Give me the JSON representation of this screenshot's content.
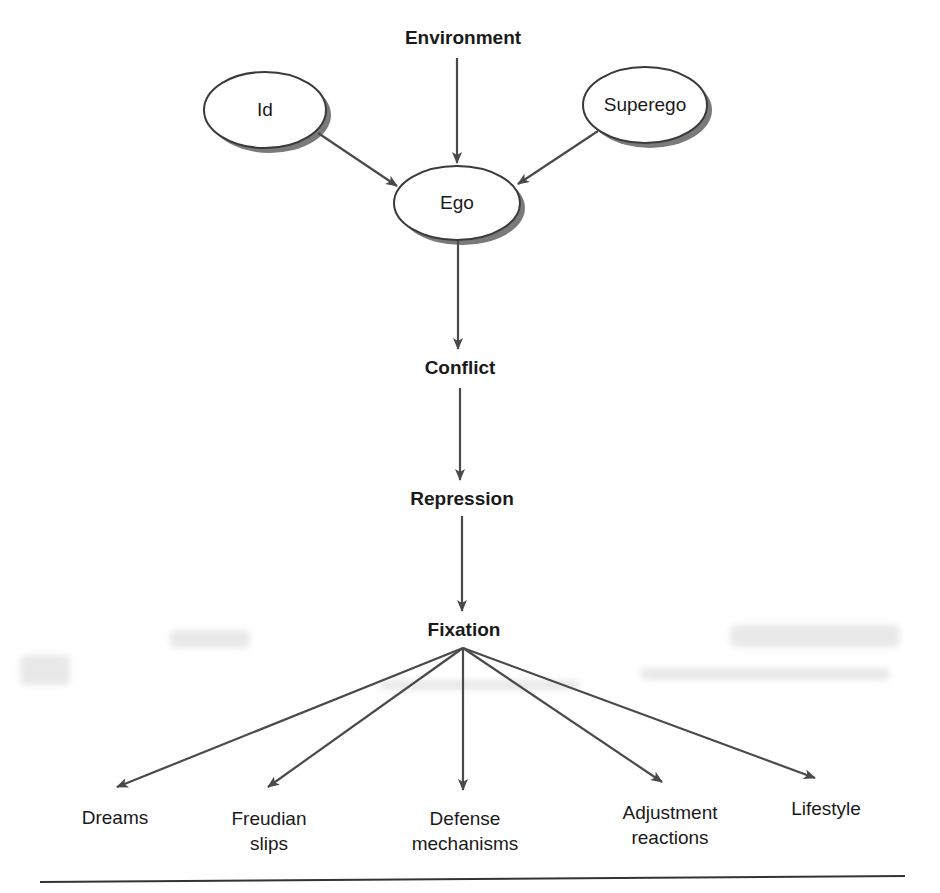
{
  "diagram": {
    "title": "",
    "colors": {
      "line": "#4a4a4a",
      "ellipse_fill": "#ffffff",
      "ellipse_stroke": "#3a3a3a",
      "shadow": "#7a7a7a",
      "text": "#1a1a1a"
    },
    "nodes": [
      {
        "id": "environment",
        "label": "Environment",
        "shape": "text",
        "bold": true,
        "x": 463,
        "y": 38
      },
      {
        "id": "id",
        "label": "Id",
        "shape": "ellipse",
        "x": 265,
        "y": 110,
        "rx": 61,
        "ry": 38
      },
      {
        "id": "superego",
        "label": "Superego",
        "shape": "ellipse",
        "x": 645,
        "y": 105,
        "rx": 62,
        "ry": 38
      },
      {
        "id": "ego",
        "label": "Ego",
        "shape": "ellipse",
        "x": 457,
        "y": 203,
        "rx": 63,
        "ry": 37
      },
      {
        "id": "conflict",
        "label": "Conflict",
        "shape": "text",
        "bold": true,
        "x": 460,
        "y": 368
      },
      {
        "id": "repression",
        "label": "Repression",
        "shape": "text",
        "bold": true,
        "x": 462,
        "y": 499
      },
      {
        "id": "fixation",
        "label": "Fixation",
        "shape": "text",
        "bold": true,
        "x": 464,
        "y": 630
      },
      {
        "id": "dreams",
        "label": "Dreams",
        "shape": "text",
        "x": 115,
        "y": 818
      },
      {
        "id": "freudian_slips",
        "label": "Freudian\nslips",
        "shape": "text",
        "x": 269,
        "y": 831
      },
      {
        "id": "defense_mechanisms",
        "label": "Defense\nmechanisms",
        "shape": "text",
        "x": 465,
        "y": 831
      },
      {
        "id": "adjustment_reactions",
        "label": "Adjustment\nreactions",
        "shape": "text",
        "x": 670,
        "y": 825
      },
      {
        "id": "lifestyle",
        "label": "Lifestyle",
        "shape": "text",
        "x": 826,
        "y": 809
      }
    ],
    "edges": [
      {
        "from": "environment",
        "to": "ego",
        "x1": 457,
        "y1": 58,
        "x2": 457,
        "y2": 163
      },
      {
        "from": "id",
        "to": "ego",
        "x1": 318,
        "y1": 133,
        "x2": 397,
        "y2": 186
      },
      {
        "from": "superego",
        "to": "ego",
        "x1": 598,
        "y1": 131,
        "x2": 518,
        "y2": 184
      },
      {
        "from": "ego",
        "to": "conflict",
        "x1": 458,
        "y1": 241,
        "x2": 458,
        "y2": 349
      },
      {
        "from": "conflict",
        "to": "repression",
        "x1": 460,
        "y1": 388,
        "x2": 460,
        "y2": 480
      },
      {
        "from": "repression",
        "to": "fixation",
        "x1": 462,
        "y1": 516,
        "x2": 462,
        "y2": 611
      },
      {
        "from": "fixation",
        "to": "dreams",
        "x1": 463,
        "y1": 648,
        "x2": 117,
        "y2": 787
      },
      {
        "from": "fixation",
        "to": "freudian_slips",
        "x1": 463,
        "y1": 648,
        "x2": 268,
        "y2": 787
      },
      {
        "from": "fixation",
        "to": "defense_mechanisms",
        "x1": 463,
        "y1": 648,
        "x2": 463,
        "y2": 790
      },
      {
        "from": "fixation",
        "to": "adjustment_reactions",
        "x1": 463,
        "y1": 648,
        "x2": 662,
        "y2": 782
      },
      {
        "from": "fixation",
        "to": "lifestyle",
        "x1": 463,
        "y1": 648,
        "x2": 815,
        "y2": 778
      }
    ],
    "bottom_rule": {
      "x1": 40,
      "y1": 882,
      "x2": 905,
      "y2": 876
    }
  }
}
